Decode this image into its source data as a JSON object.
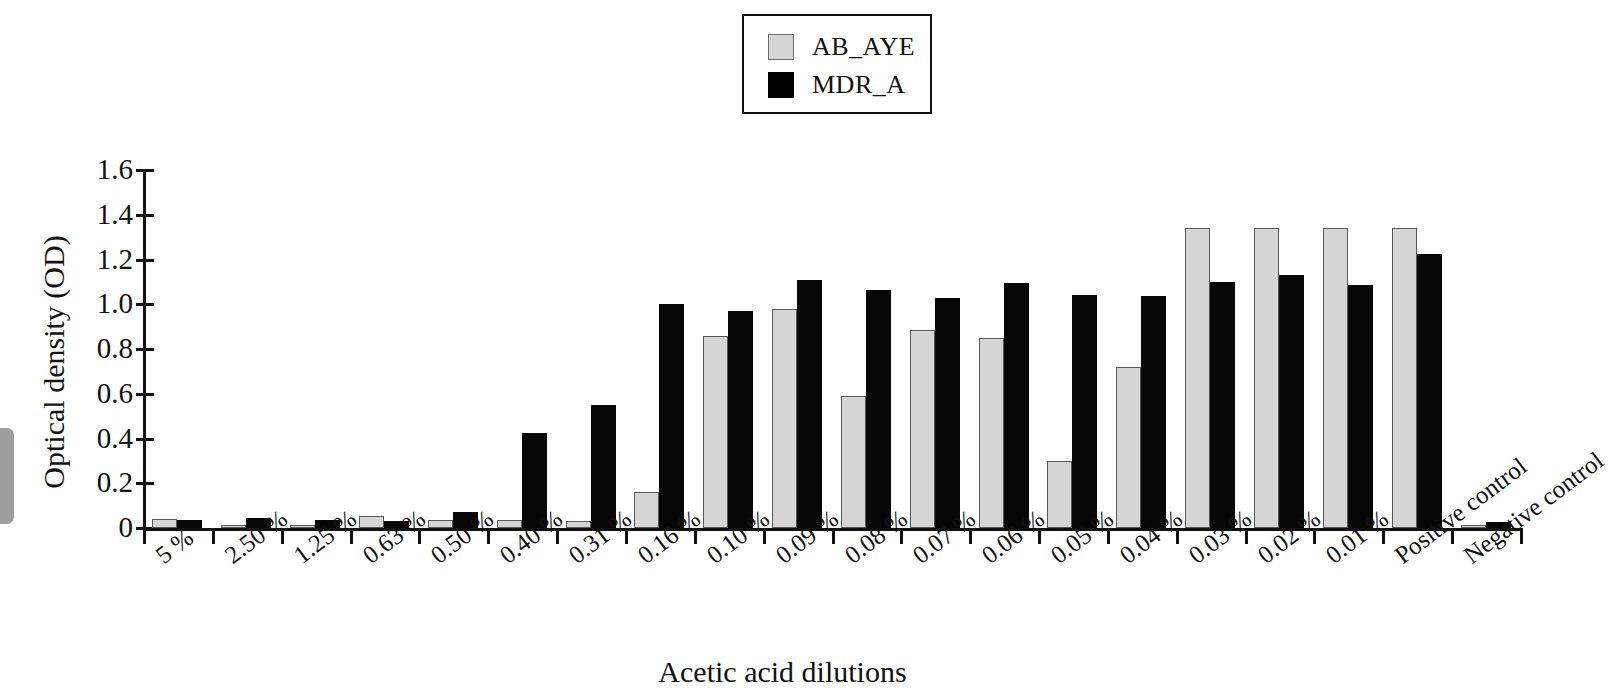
{
  "chart_data": {
    "type": "bar",
    "title": "",
    "xlabel": "Acetic acid dilutions",
    "ylabel": "Optical density (OD)",
    "ylim": [
      0,
      1.6
    ],
    "yticks": [
      "0",
      "0.2",
      "0.4",
      "0.6",
      "0.8",
      "1.0",
      "1.2",
      "1.4",
      "1.6"
    ],
    "ytick_values": [
      0,
      0.2,
      0.4,
      0.6,
      0.8,
      1.0,
      1.2,
      1.4,
      1.6
    ],
    "grid": false,
    "legend_position": "top-center",
    "categories": [
      "5 %",
      "2.50 %",
      "1.25 %",
      "0.63 %",
      "0.50 %",
      "0.40 %",
      "0.31 %",
      "0.16 %",
      "0.10 %",
      "0.09 %",
      "0.08 %",
      "0.07 %",
      "0.06 %",
      "0.05 %",
      "0.04 %",
      "0.03 %",
      "0.02 %",
      "0.01 %",
      "Positive control",
      "Negative control"
    ],
    "series": [
      {
        "name": "AB_AYE",
        "color": "#d5d5d5",
        "values": [
          0.04,
          0.015,
          0.015,
          0.055,
          0.035,
          0.035,
          0.03,
          0.16,
          0.86,
          0.98,
          0.59,
          0.885,
          0.85,
          0.3,
          0.72,
          1.34,
          1.34,
          1.34,
          1.34,
          0.01
        ]
      },
      {
        "name": "MDR_A",
        "color": "#070707",
        "values": [
          0.035,
          0.045,
          0.035,
          0.03,
          0.07,
          0.425,
          0.55,
          1.0,
          0.97,
          1.11,
          1.065,
          1.03,
          1.095,
          1.04,
          1.035,
          1.1,
          1.13,
          1.085,
          1.225,
          0.025
        ]
      }
    ]
  },
  "legend": {
    "entries": [
      {
        "label": "AB_AYE",
        "swatch": "gray"
      },
      {
        "label": "MDR_A",
        "swatch": "black"
      }
    ]
  }
}
